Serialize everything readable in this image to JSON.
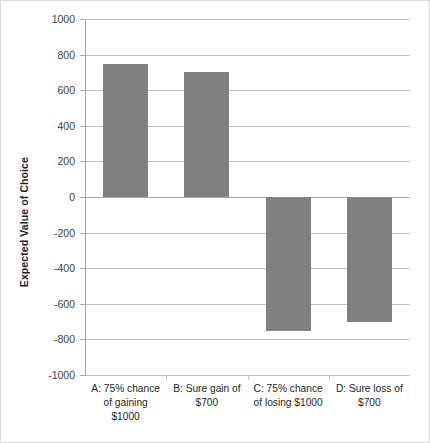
{
  "chart_data": {
    "type": "bar",
    "title": "",
    "xlabel": "",
    "ylabel": "Expected Value of Choice",
    "categories": [
      "A: 75% chance of gaining $1000",
      "B: Sure gain of $700",
      "C: 75% chance of losing $1000",
      "D: Sure loss of $700"
    ],
    "category_lines": [
      [
        "A: 75% chance",
        "of gaining",
        "$1000"
      ],
      [
        "B: Sure gain of",
        "$700"
      ],
      [
        "C: 75% chance",
        "of losing $1000"
      ],
      [
        "D: Sure loss of",
        "$700"
      ]
    ],
    "values": [
      750,
      700,
      -750,
      -700
    ],
    "ylim": [
      -1000,
      1000
    ],
    "ytick_labels": [
      "1000",
      "800",
      "600",
      "400",
      "200",
      "0",
      "-200",
      "-400",
      "-600",
      "-800",
      "-1000"
    ],
    "ytick_values": [
      1000,
      800,
      600,
      400,
      200,
      0,
      -200,
      -400,
      -600,
      -800,
      -1000
    ],
    "grid": true,
    "legend": false,
    "bar_color": "#808080",
    "grid_color": "#bfbfbf",
    "axis_color": "#a6a6a6"
  }
}
